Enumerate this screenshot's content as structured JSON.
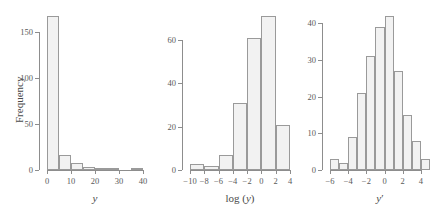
{
  "figure": {
    "background": "#ffffff",
    "bar_fill": "#f2f2f2",
    "bar_stroke": "#9a9a9a",
    "axis_color": "#8d8d8d",
    "text_color": "#4a4a4a"
  },
  "panels": [
    {
      "name": "histogram-y",
      "ylabel": "Frequency",
      "xlabel_parts": {
        "pre": "",
        "italic": "y",
        "post": ""
      },
      "xlabel_text": "y"
    },
    {
      "name": "histogram-log-y",
      "ylabel": "",
      "xlabel_parts": {
        "pre": "log (",
        "italic": "y",
        "post": ")"
      },
      "xlabel_text": "log (y)"
    },
    {
      "name": "histogram-y-prime",
      "ylabel": "",
      "xlabel_parts": {
        "pre": "",
        "italic": "y",
        "post": "′"
      },
      "xlabel_text": "y′"
    }
  ],
  "chart_data": [
    {
      "type": "bar",
      "subtype": "histogram",
      "panel": 0,
      "title": "",
      "xlabel": "y",
      "ylabel": "Frequency",
      "bin_edges": [
        0,
        5,
        10,
        15,
        20,
        25,
        30,
        35,
        40
      ],
      "categories": [
        "0-5",
        "5-10",
        "10-15",
        "15-20",
        "20-25",
        "25-30",
        "30-35",
        "35-40"
      ],
      "values": [
        168,
        16,
        8,
        3,
        1,
        1,
        0,
        2
      ],
      "xticks": [
        0,
        10,
        20,
        30,
        40
      ],
      "xticklabels": [
        "0",
        "10",
        "20",
        "30",
        "40"
      ],
      "yticks": [
        0,
        50,
        100,
        150
      ],
      "yticklabels": [
        "0",
        "50",
        "100",
        "150"
      ],
      "xlim": [
        0,
        40
      ],
      "ylim": [
        0,
        172
      ],
      "grid": false,
      "legend": false
    },
    {
      "type": "bar",
      "subtype": "histogram",
      "panel": 1,
      "title": "",
      "xlabel": "log (y)",
      "ylabel": "",
      "bin_edges": [
        -10,
        -8,
        -6,
        -4,
        -2,
        0,
        2,
        4
      ],
      "categories": [
        "-10--8",
        "-8--6",
        "-6--4",
        "-4--2",
        "-2-0",
        "0-2",
        "2-4"
      ],
      "values": [
        3,
        2,
        7,
        31,
        61,
        71,
        21
      ],
      "xticks": [
        -10,
        -8,
        -6,
        -4,
        -2,
        0,
        2,
        4
      ],
      "xticklabels": [
        "−10",
        "−8",
        "−6",
        "−4",
        "−2",
        "0",
        "2",
        "4"
      ],
      "yticks": [
        0,
        20,
        40,
        60
      ],
      "yticklabels": [
        "0",
        "20",
        "40",
        "60"
      ],
      "xlim": [
        -10,
        4
      ],
      "ylim": [
        0,
        73
      ],
      "grid": false,
      "legend": false
    },
    {
      "type": "bar",
      "subtype": "histogram",
      "panel": 2,
      "title": "",
      "xlabel": "y′",
      "ylabel": "",
      "bin_edges": [
        -6,
        -5,
        -4,
        -3,
        -2,
        -1,
        0,
        1,
        2,
        3,
        4,
        5
      ],
      "categories": [
        "-6--5",
        "-5--4",
        "-4--3",
        "-3--2",
        "-2--1",
        "-1-0",
        "0-1",
        "1-2",
        "2-3",
        "3-4",
        "4-5"
      ],
      "values": [
        3,
        2,
        9,
        21,
        31,
        39,
        42,
        27,
        15,
        8,
        3
      ],
      "xticks": [
        -6,
        -4,
        -2,
        0,
        2,
        4
      ],
      "xticklabels": [
        "−6",
        "−4",
        "−2",
        "0",
        "2",
        "4"
      ],
      "yticks": [
        0,
        10,
        20,
        30,
        40
      ],
      "yticklabels": [
        "0",
        "10",
        "20",
        "30",
        "40"
      ],
      "xlim": [
        -6,
        5
      ],
      "ylim": [
        0,
        43
      ],
      "grid": false,
      "legend": false
    }
  ]
}
